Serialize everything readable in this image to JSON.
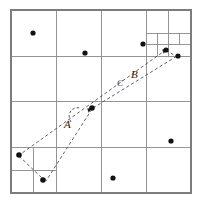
{
  "figure": {
    "canvas": {
      "width": 202,
      "height": 205
    },
    "background_color": "#ffffff",
    "grid_color": "#8a8a8a",
    "point_color": "#111111",
    "path_color": "#4a4a4a"
  },
  "labels": {
    "a": "A",
    "b": "B",
    "c": "C"
  },
  "chart_data": {
    "type": "scatter",
    "xlabel": "",
    "ylabel": "",
    "xlim": [
      11,
      191
    ],
    "ylim": [
      10,
      193
    ],
    "grid": true,
    "legend": "none",
    "outer_square": {
      "x": 11,
      "y": 10,
      "width": 180,
      "height": 183
    },
    "subdivision_lines": [
      {
        "name": "root-vertical-midline",
        "x1": 101,
        "y1": 10,
        "x2": 101,
        "y2": 193
      },
      {
        "name": "root-horizontal-midline",
        "x1": 11,
        "y1": 101,
        "x2": 191,
        "y2": 101
      },
      {
        "name": "nw-vertical",
        "x1": 56,
        "y1": 10,
        "x2": 56,
        "y2": 101
      },
      {
        "name": "nw-horizontal",
        "x1": 11,
        "y1": 56,
        "x2": 101,
        "y2": 56
      },
      {
        "name": "ne-vertical",
        "x1": 146,
        "y1": 10,
        "x2": 146,
        "y2": 101
      },
      {
        "name": "ne-horizontal",
        "x1": 101,
        "y1": 56,
        "x2": 191,
        "y2": 56
      },
      {
        "name": "sw-vertical",
        "x1": 56,
        "y1": 101,
        "x2": 56,
        "y2": 193
      },
      {
        "name": "sw-horizontal",
        "x1": 11,
        "y1": 147,
        "x2": 101,
        "y2": 147
      },
      {
        "name": "se-vertical",
        "x1": 146,
        "y1": 101,
        "x2": 146,
        "y2": 193
      },
      {
        "name": "se-horizontal",
        "x1": 101,
        "y1": 147,
        "x2": 191,
        "y2": 147
      },
      {
        "name": "ne-ne-vertical",
        "x1": 168,
        "y1": 10,
        "x2": 168,
        "y2": 56
      },
      {
        "name": "ne-ne-horizontal",
        "x1": 146,
        "y1": 33,
        "x2": 191,
        "y2": 33
      },
      {
        "name": "ne-ne-sw-vertical",
        "x1": 157,
        "y1": 33,
        "x2": 157,
        "y2": 56
      },
      {
        "name": "ne-ne-sw-horizontal",
        "x1": 146,
        "y1": 44,
        "x2": 191,
        "y2": 44
      },
      {
        "name": "ne-deep-vertical",
        "x1": 179,
        "y1": 33,
        "x2": 179,
        "y2": 44
      },
      {
        "name": "sw-sw-vertical",
        "x1": 33,
        "y1": 147,
        "x2": 33,
        "y2": 193
      },
      {
        "name": "sw-sw-horizontal",
        "x1": 11,
        "y1": 170,
        "x2": 56,
        "y2": 170
      }
    ],
    "points": [
      {
        "id": "p1",
        "x": 33,
        "y": 33,
        "r": 2.6
      },
      {
        "id": "p2",
        "x": 85,
        "y": 53,
        "r": 2.6
      },
      {
        "id": "p3",
        "x": 143,
        "y": 44,
        "r": 2.6
      },
      {
        "id": "p4",
        "x": 166,
        "y": 50,
        "r": 2.6
      },
      {
        "id": "p5",
        "x": 178,
        "y": 56,
        "r": 2.6
      },
      {
        "id": "p6",
        "x": 92,
        "y": 108,
        "r": 2.8
      },
      {
        "id": "p7",
        "x": 171,
        "y": 141,
        "r": 2.6
      },
      {
        "id": "p8",
        "x": 19,
        "y": 155,
        "r": 2.8
      },
      {
        "id": "p9",
        "x": 43,
        "y": 180,
        "r": 2.8
      },
      {
        "id": "p10",
        "x": 113,
        "y": 178,
        "r": 2.6
      }
    ],
    "path_segments": [
      {
        "name": "long-lower-edge",
        "x1": 18,
        "y1": 156,
        "x2": 167,
        "y2": 49
      },
      {
        "name": "long-upper-edge",
        "x1": 93,
        "y1": 108,
        "x2": 177,
        "y2": 56
      },
      {
        "name": "branch-to-sw-corner",
        "x1": 92,
        "y1": 109,
        "x2": 46,
        "y2": 181
      },
      {
        "name": "sw-local-link",
        "x1": 19,
        "y1": 156,
        "x2": 43,
        "y2": 179
      },
      {
        "name": "ne-local-link",
        "x1": 166,
        "y1": 50,
        "x2": 177,
        "y2": 57
      }
    ],
    "arrows": [
      {
        "name": "arrow-to-center",
        "x": 92,
        "y": 108,
        "angle": -35
      },
      {
        "name": "arrow-ne-top",
        "x": 167,
        "y": 49,
        "angle": -35
      }
    ]
  }
}
